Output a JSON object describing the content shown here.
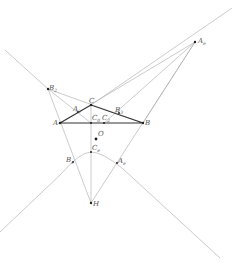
{
  "diagram": {
    "type": "geometry-construction",
    "colors": {
      "background": "#ffffff",
      "thin_lines": "#a8a8a8",
      "triangle": "#333333",
      "points": "#222222",
      "labels": "#555555"
    },
    "points": {
      "A": {
        "x": 60,
        "y": 123,
        "label": "A",
        "sub": ""
      },
      "B": {
        "x": 143,
        "y": 123,
        "label": "B",
        "sub": ""
      },
      "C": {
        "x": 91,
        "y": 105,
        "label": "C",
        "sub": ""
      },
      "Ae": {
        "x": 195,
        "y": 42,
        "label": "A",
        "sub": "e"
      },
      "B2": {
        "x": 48,
        "y": 89,
        "label": "B",
        "sub": "2"
      },
      "A2": {
        "x": 78,
        "y": 112,
        "label": "A",
        "sub": "2"
      },
      "B3": {
        "x": 119,
        "y": 113,
        "label": "B",
        "sub": "3"
      },
      "C0": {
        "x": 91,
        "y": 123,
        "label": "C",
        "sub": "0"
      },
      "C2": {
        "x": 104,
        "y": 123,
        "label": "C",
        "sub": "2"
      },
      "O": {
        "x": 96,
        "y": 139,
        "label": "O",
        "sub": ""
      },
      "Ce": {
        "x": 91,
        "y": 152,
        "label": "C",
        "sub": "e"
      },
      "Be": {
        "x": 73,
        "y": 162,
        "label": "B",
        "sub": "e"
      },
      "Ae2": {
        "x": 117,
        "y": 163,
        "label": "A",
        "sub": "e"
      },
      "H": {
        "x": 91,
        "y": 203,
        "label": "H",
        "sub": ""
      }
    }
  }
}
